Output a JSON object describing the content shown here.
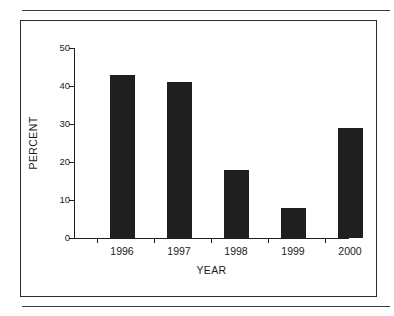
{
  "figure": {
    "frame_border_color": "#2b2b2b",
    "rule_color": "#3a3a3a",
    "background": "#ffffff"
  },
  "chart_data": {
    "type": "bar",
    "title": "",
    "subtitle": "",
    "xlabel": "YEAR",
    "ylabel": "PERCENT",
    "categories": [
      "1996",
      "1997",
      "1998",
      "1999",
      "2000"
    ],
    "values": [
      43,
      41,
      18,
      8,
      29
    ],
    "series": [
      {
        "name": "PERCENT",
        "values": [
          43,
          41,
          18,
          8,
          29
        ],
        "color": "#1f1f1f"
      }
    ],
    "ylim": [
      0,
      50
    ],
    "ytick_labels": [
      "0",
      "10",
      "20",
      "30",
      "40",
      "50"
    ],
    "ytick_values": [
      0,
      10,
      20,
      30,
      40,
      50
    ],
    "xtick_labels": [
      "1996",
      "1997",
      "1998",
      "1999",
      "2000"
    ],
    "grid": false,
    "legend": false,
    "legend_position": "none",
    "bar_color": "#1f1f1f",
    "axis_color": "#1c1c1c",
    "annotations": []
  }
}
